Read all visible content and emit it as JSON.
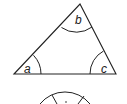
{
  "diagram": {
    "type": "triangle-angles",
    "stroke_color": "#222222",
    "background": "#ffffff",
    "triangle": {
      "vertices": {
        "left": {
          "x": 14,
          "y": 74
        },
        "top": {
          "x": 80,
          "y": 4
        },
        "right": {
          "x": 116,
          "y": 74
        }
      },
      "angles": [
        {
          "label": "a",
          "vertex": "left"
        },
        {
          "label": "b",
          "vertex": "top"
        },
        {
          "label": "c",
          "vertex": "right"
        }
      ]
    },
    "second_shape": {
      "partially_visible": true,
      "description": "top of a circle/arc cut off at image bottom with two inner tick lines"
    }
  }
}
